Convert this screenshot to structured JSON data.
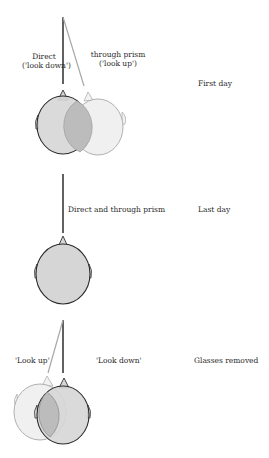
{
  "panels": [
    {
      "condition": "First day",
      "labels": {
        "left": [
          "Direct",
          "('look down')"
        ],
        "right": [
          "through prism",
          "('look up')"
        ]
      }
    },
    {
      "condition": "Last day",
      "labels": {
        "center": "Direct and through prism"
      }
    },
    {
      "condition": "Glasses removed",
      "labels": {
        "left": "'Look up'",
        "right": "'Look down'"
      }
    }
  ],
  "colors": {
    "dark_line": "#1e1e1e",
    "light_line": "#a8a8a8",
    "head_fill": "#d8d8d8",
    "light_head_fill": "#efefef",
    "overlap_fill": "#bdbdbd"
  }
}
